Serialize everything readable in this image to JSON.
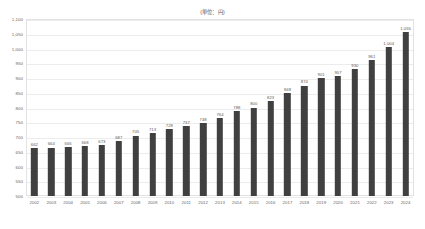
{
  "chart_data": {
    "type": "bar",
    "title": "(単位：円)",
    "xlabel": "",
    "ylabel": "",
    "ylim": [
      500,
      1100
    ],
    "ytick_step": 50,
    "grid": true,
    "legend": false,
    "bar_color": "#404040",
    "categories": [
      "2002",
      "2003",
      "2004",
      "2005",
      "2006",
      "2007",
      "2008",
      "2009",
      "2010",
      "2011",
      "2012",
      "2013",
      "2014",
      "2015",
      "2016",
      "2017",
      "2018",
      "2019",
      "2020",
      "2021",
      "2022",
      "2023",
      "2024"
    ],
    "values": [
      662,
      664,
      665,
      668,
      673,
      687,
      705,
      713,
      728,
      737,
      748,
      764,
      788,
      800,
      823,
      848,
      874,
      901,
      907,
      930,
      961,
      1004,
      1055
    ],
    "value_labels": [
      "662",
      "664",
      "665",
      "668",
      "673",
      "687",
      "705",
      "713",
      "728",
      "737",
      "748",
      "764",
      "788",
      "800",
      "823",
      "848",
      "874",
      "901",
      "907",
      "930",
      "961",
      "1,004",
      "1,055"
    ],
    "ytick_labels": [
      "1,100",
      "1,050",
      "1,000",
      "950",
      "900",
      "850",
      "800",
      "750",
      "700",
      "650",
      "600",
      "550",
      "500"
    ],
    "ytick_values": [
      1100,
      1050,
      1000,
      950,
      900,
      850,
      800,
      750,
      700,
      650,
      600,
      550,
      500
    ]
  }
}
